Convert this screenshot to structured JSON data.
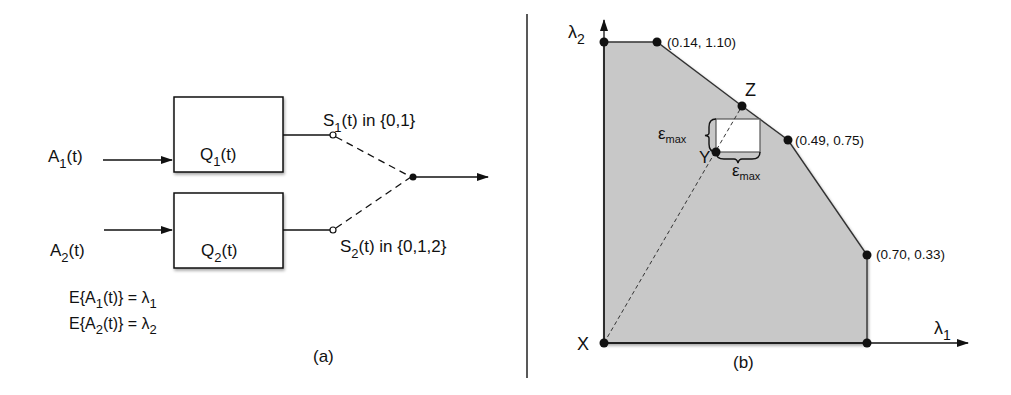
{
  "panel_a": {
    "caption": "(a)",
    "inputs": [
      {
        "base": "A",
        "sub": "1",
        "tail": "(t)"
      },
      {
        "base": "A",
        "sub": "2",
        "tail": "(t)"
      }
    ],
    "queues": [
      {
        "base": "Q",
        "sub": "1",
        "tail": "(t)"
      },
      {
        "base": "Q",
        "sub": "2",
        "tail": "(t)"
      }
    ],
    "switches": [
      {
        "base": "S",
        "sub": "1",
        "tail": "(t) in {0,1}"
      },
      {
        "base": "S",
        "sub": "2",
        "tail": "(t) in {0,1,2}"
      }
    ],
    "equations": [
      {
        "lhs_pre": "E{A",
        "lhs_sub": "1",
        "lhs_post": "(t)} = λ",
        "rhs_sub": "1"
      },
      {
        "lhs_pre": "E{A",
        "lhs_sub": "2",
        "lhs_post": "(t)} = λ",
        "rhs_sub": "2"
      }
    ]
  },
  "panel_b": {
    "caption": "(b)",
    "x_axis": {
      "base": "λ",
      "sub": "1"
    },
    "y_axis": {
      "base": "λ",
      "sub": "2"
    },
    "vertices": [
      {
        "label": "(0.14, 1.10)"
      },
      {
        "label": "(0.49, 0.75)"
      },
      {
        "label": "(0.70, 0.33)"
      }
    ],
    "points": {
      "X": "X",
      "Y": "Y",
      "Z": "Z"
    },
    "epsilon": {
      "base": "ε",
      "sub": "max"
    },
    "region_fill": "#c8c8c8"
  }
}
